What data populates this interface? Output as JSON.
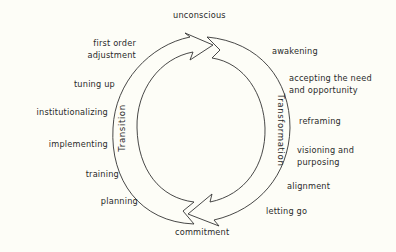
{
  "diagram": {
    "type": "cycle",
    "colors": {
      "background": "#fdfdf7",
      "stroke": "#333333",
      "text": "#2a2a2a"
    },
    "top_label": "unconscious",
    "bottom_label": "commitment",
    "arcs": [
      {
        "name": "Transition",
        "side": "left",
        "direction": "bottom-to-top"
      },
      {
        "name": "Transformation",
        "side": "right",
        "direction": "top-to-bottom"
      }
    ],
    "left_stages": [
      {
        "lines": [
          "first order",
          "adjustment"
        ]
      },
      {
        "lines": [
          "tuning up"
        ]
      },
      {
        "lines": [
          "institutionalizing"
        ]
      },
      {
        "lines": [
          "implementing"
        ]
      },
      {
        "lines": [
          "training"
        ]
      },
      {
        "lines": [
          "planning"
        ]
      }
    ],
    "right_stages": [
      {
        "lines": [
          "awakening"
        ]
      },
      {
        "lines": [
          "accepting the need",
          "and opportunity"
        ]
      },
      {
        "lines": [
          "reframing"
        ]
      },
      {
        "lines": [
          "visioning and",
          "purposing"
        ]
      },
      {
        "lines": [
          "alignment"
        ]
      },
      {
        "lines": [
          "letting go"
        ]
      }
    ]
  }
}
